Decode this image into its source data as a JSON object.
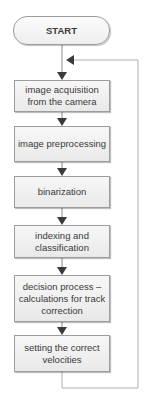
{
  "diagram": {
    "type": "flowchart",
    "start": {
      "label": "START"
    },
    "steps": [
      {
        "label": "image acquisition from the camera"
      },
      {
        "label": "image preprocessing"
      },
      {
        "label": "binarization"
      },
      {
        "label": "indexing and classification"
      },
      {
        "label": "decision process – calculations for track correction"
      },
      {
        "label": "setting the correct velocities"
      }
    ],
    "loop": {
      "from": "setting the correct velocities",
      "to": "image acquisition from the camera"
    },
    "colors": {
      "box_border": "#9c9c9c",
      "box_fill": "#eeeeee",
      "line": "#8a8a8a",
      "arrow": "#3a3a3a",
      "text": "#3a3a3a"
    }
  }
}
